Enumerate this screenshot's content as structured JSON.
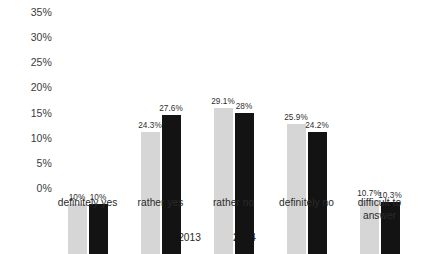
{
  "chart_data": {
    "type": "bar",
    "title": "",
    "subtitle": "",
    "xlabel": "",
    "ylabel": "",
    "ylim": [
      0,
      35
    ],
    "grid": false,
    "legend_position": "bottom",
    "categories": [
      "definitely yes",
      "rather yes",
      "rather no",
      "definitely no",
      "difficult to\nanswer"
    ],
    "ytick_labels": [
      "35%",
      "30%",
      "25%",
      "20%",
      "15%",
      "10%",
      "5%",
      "0%"
    ],
    "ytick_values": [
      35,
      30,
      25,
      20,
      15,
      10,
      5,
      0
    ],
    "series": [
      {
        "name": "2013",
        "color": "#d6d6d6",
        "values": [
          10,
          24.3,
          29.1,
          25.9,
          10.7
        ],
        "value_labels": [
          "10%",
          "24.3%",
          "29.1%",
          "25.9%",
          "10.7%"
        ]
      },
      {
        "name": "2014",
        "color": "#131313",
        "values": [
          10,
          27.6,
          28,
          24.2,
          10.3
        ],
        "value_labels": [
          "10%",
          "27.6%",
          "28%",
          "24.2%",
          "10.3%"
        ]
      }
    ]
  }
}
